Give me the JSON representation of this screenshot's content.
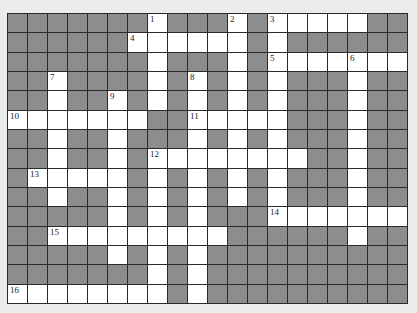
{
  "puzzle": {
    "cols": 20,
    "rows": 15,
    "colors": {
      "block": "#8d8d8d",
      "open": "#ffffff",
      "line": "#2a2a2a",
      "background": "#ececec"
    },
    "grid": [
      "00000001000101111100",
      "00000011111101000000",
      "00000001000101111111",
      "00100001010101000100",
      "00100101010101000100",
      "11111110011111000100",
      "00100100010101000100",
      "00100101111111100100",
      "01111101010101000100",
      "00100101010101000100",
      "00000101010001111111",
      "00111111111000000100",
      "00000101010000000000",
      "00000001010000000000",
      "11111111010000000000"
    ],
    "numbers": [
      {
        "n": "1",
        "r": 0,
        "c": 7
      },
      {
        "n": "2",
        "r": 0,
        "c": 11
      },
      {
        "n": "3",
        "r": 0,
        "c": 13
      },
      {
        "n": "4",
        "r": 1,
        "c": 6
      },
      {
        "n": "5",
        "r": 2,
        "c": 13
      },
      {
        "n": "6",
        "r": 2,
        "c": 17
      },
      {
        "n": "7",
        "r": 3,
        "c": 2
      },
      {
        "n": "8",
        "r": 3,
        "c": 9
      },
      {
        "n": "9",
        "r": 4,
        "c": 5
      },
      {
        "n": "10",
        "r": 5,
        "c": 0
      },
      {
        "n": "11",
        "r": 5,
        "c": 9
      },
      {
        "n": "12",
        "r": 7,
        "c": 7
      },
      {
        "n": "13",
        "r": 8,
        "c": 1
      },
      {
        "n": "14",
        "r": 10,
        "c": 13
      },
      {
        "n": "15",
        "r": 11,
        "c": 2
      },
      {
        "n": "16",
        "r": 14,
        "c": 0
      }
    ]
  }
}
